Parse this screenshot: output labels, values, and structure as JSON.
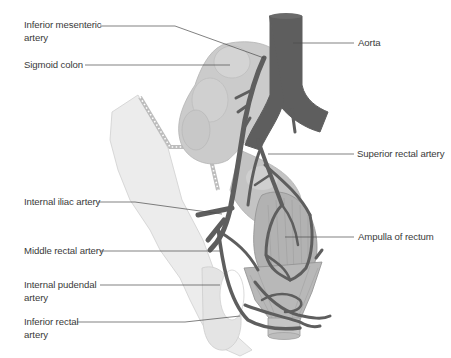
{
  "figure": {
    "labels_left": [
      {
        "id": "inferior-mesenteric-artery",
        "text": "Inferior mesenteric\nartery"
      },
      {
        "id": "sigmoid-colon",
        "text": "Sigmoid colon"
      },
      {
        "id": "internal-iliac-artery",
        "text": "Internal iliac artery"
      },
      {
        "id": "middle-rectal-artery",
        "text": "Middle rectal artery"
      },
      {
        "id": "internal-pudendal-artery",
        "text": "Internal pudendal\nartery"
      },
      {
        "id": "inferior-rectal-artery",
        "text": "Inferior rectal\nartery"
      }
    ],
    "labels_right": [
      {
        "id": "aorta",
        "text": "Aorta"
      },
      {
        "id": "superior-rectal-artery",
        "text": "Superior rectal artery"
      },
      {
        "id": "ampulla-of-rectum",
        "text": "Ampulla of rectum"
      }
    ],
    "colors": {
      "artery": "#5e5e5e",
      "colon": "#c9c9c9",
      "pelvis": "#e6e6e6",
      "rectum": "#a9a9a9",
      "leader_line": "#4a4a4a",
      "text": "#3a3a3a"
    }
  }
}
